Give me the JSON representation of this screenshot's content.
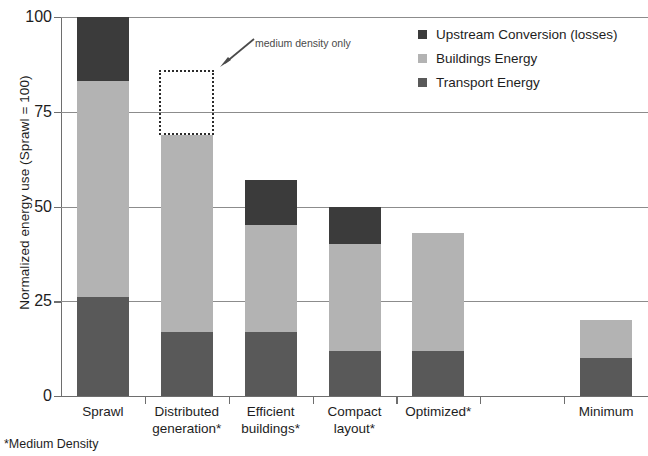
{
  "chart_data": {
    "type": "bar",
    "title": "",
    "subtitle": "",
    "xlabel": "",
    "ylabel": "Normalized energy use (Sprawl = 100)",
    "ylim": [
      0,
      100
    ],
    "yticks": [
      0,
      25,
      50,
      75,
      100
    ],
    "ytick_labels": [
      "0",
      "25",
      "50",
      "75",
      "100"
    ],
    "grid": true,
    "grid_axis": "y",
    "stacked": true,
    "legend_position": "top-right",
    "categories": [
      "Sprawl",
      "Distributed generation*",
      "Efficient buildings*",
      "Compact layout*",
      "Optimized*",
      "",
      "Minimum"
    ],
    "category_lines": [
      [
        "Sprawl"
      ],
      [
        "Distributed",
        "generation*"
      ],
      [
        "Efficient",
        "buildings*"
      ],
      [
        "Compact",
        "layout*"
      ],
      [
        "Optimized*"
      ],
      [
        ""
      ],
      [
        "Minimum"
      ]
    ],
    "series": [
      {
        "name": "Transport Energy",
        "color": "#595959",
        "values": [
          26,
          17,
          17,
          12,
          12,
          null,
          10
        ]
      },
      {
        "name": "Buildings Energy",
        "color": "#b3b3b3",
        "values": [
          57,
          52,
          28,
          28,
          31,
          null,
          10
        ]
      },
      {
        "name": "Upstream Conversion (losses)",
        "color": "#3b3b3b",
        "values": [
          17,
          0,
          12,
          10,
          0,
          null,
          0
        ]
      }
    ],
    "totals": [
      100,
      69,
      57,
      50,
      43,
      null,
      20
    ],
    "annotations": [
      {
        "text": "medium density only",
        "target_category": "Distributed generation*",
        "ghost_range": [
          69,
          86
        ],
        "note": "dotted outline shows energy use without distributed generation"
      }
    ],
    "footnote": "*Medium Density"
  },
  "legend": {
    "items": [
      {
        "label": "Upstream Conversion (losses)",
        "color": "#3b3b3b"
      },
      {
        "label": "Buildings Energy",
        "color": "#b3b3b3"
      },
      {
        "label": "Transport Energy",
        "color": "#595959"
      }
    ]
  }
}
